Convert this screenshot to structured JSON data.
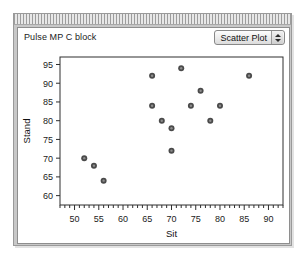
{
  "window": {
    "title": "Pulse MP C block",
    "titlebar_name": "window-titlebar"
  },
  "toolbar": {
    "plot_type_label": "Scatter Plot",
    "plot_type_options": [
      "Scatter Plot"
    ],
    "stepper_up_icon": "arrow-up-icon",
    "stepper_down_icon": "arrow-down-icon"
  },
  "chart_data": {
    "type": "scatter",
    "title": "",
    "xlabel": "Sit",
    "ylabel": "Stand",
    "xlim": [
      47,
      93
    ],
    "ylim": [
      57.5,
      97
    ],
    "xticks": [
      50,
      55,
      60,
      65,
      70,
      75,
      80,
      85,
      90
    ],
    "yticks": [
      60,
      65,
      70,
      75,
      80,
      85,
      90,
      95
    ],
    "xtick_labels": [
      "50",
      "55",
      "60",
      "65",
      "70",
      "75",
      "80",
      "85",
      "90"
    ],
    "ytick_labels": [
      "60",
      "65",
      "70",
      "75",
      "80",
      "85",
      "90",
      "95"
    ],
    "x_minor_step": 1,
    "y_minor_step": 1,
    "grid": false,
    "legend": false,
    "marker": {
      "shape": "circle",
      "outer_color": "#4a4a4a",
      "inner_color": "#8d8d8d",
      "radius": 3
    },
    "points": [
      {
        "x": 52,
        "y": 70
      },
      {
        "x": 54,
        "y": 68
      },
      {
        "x": 56,
        "y": 64
      },
      {
        "x": 66,
        "y": 92
      },
      {
        "x": 66,
        "y": 84
      },
      {
        "x": 68,
        "y": 80
      },
      {
        "x": 70,
        "y": 78
      },
      {
        "x": 70,
        "y": 72
      },
      {
        "x": 72,
        "y": 94
      },
      {
        "x": 74,
        "y": 84
      },
      {
        "x": 76,
        "y": 88
      },
      {
        "x": 78,
        "y": 80
      },
      {
        "x": 80,
        "y": 84
      },
      {
        "x": 86,
        "y": 92
      }
    ]
  }
}
